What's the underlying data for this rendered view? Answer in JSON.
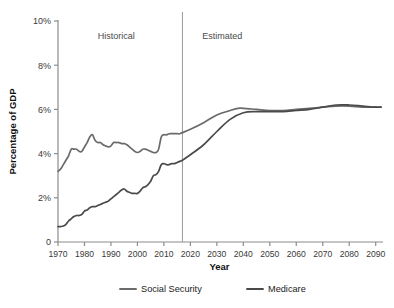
{
  "chart_data": {
    "type": "line",
    "title": "",
    "xlabel": "Year",
    "ylabel": "Percentage of GDP",
    "xlim": [
      1970,
      2092
    ],
    "ylim": [
      0,
      10
    ],
    "grid": false,
    "legend_position": "bottom",
    "x_ticks": [
      1970,
      1980,
      1990,
      2000,
      2010,
      2020,
      2030,
      2040,
      2050,
      2060,
      2070,
      2080,
      2090
    ],
    "x_tick_labels": [
      "1970",
      "1980",
      "1990",
      "2000",
      "2010",
      "2020",
      "2030",
      "2040",
      "2050",
      "2060",
      "2070",
      "2080",
      "2090"
    ],
    "y_ticks": [
      0,
      2,
      4,
      6,
      8,
      10
    ],
    "y_tick_labels": [
      "0",
      "2%",
      "4%",
      "6%",
      "8%",
      "10%"
    ],
    "annotations": [
      {
        "name": "historical-label",
        "text": "Historical",
        "x": 1992,
        "y": 9.2
      },
      {
        "name": "estimated-label",
        "text": "Estimated",
        "x": 2032,
        "y": 9.2
      },
      {
        "name": "divider-line",
        "text": "",
        "x": 2017,
        "y": 0
      }
    ],
    "divider_year": 2017,
    "colors": {
      "social_security": "#6a6a6a",
      "medicare": "#4a4a4a",
      "axis": "#8c8c8c",
      "divider": "#9a9a9a",
      "text": "#333333"
    },
    "series": [
      {
        "name": "Social Security",
        "color": "#6a6a6a",
        "x": [
          1970,
          1971,
          1972,
          1973,
          1974,
          1975,
          1976,
          1977,
          1978,
          1979,
          1980,
          1981,
          1982,
          1983,
          1984,
          1985,
          1986,
          1987,
          1988,
          1989,
          1990,
          1991,
          1992,
          1993,
          1994,
          1995,
          1996,
          1997,
          1998,
          1999,
          2000,
          2001,
          2002,
          2003,
          2004,
          2005,
          2006,
          2007,
          2008,
          2009,
          2010,
          2011,
          2012,
          2013,
          2014,
          2015,
          2016,
          2017,
          2020,
          2025,
          2030,
          2035,
          2038,
          2040,
          2045,
          2050,
          2055,
          2060,
          2065,
          2070,
          2075,
          2080,
          2085,
          2090,
          2092
        ],
        "y": [
          3.2,
          3.3,
          3.5,
          3.7,
          3.9,
          4.2,
          4.2,
          4.2,
          4.1,
          4.1,
          4.3,
          4.5,
          4.75,
          4.85,
          4.6,
          4.5,
          4.5,
          4.4,
          4.35,
          4.3,
          4.35,
          4.5,
          4.5,
          4.5,
          4.45,
          4.45,
          4.4,
          4.3,
          4.2,
          4.1,
          4.05,
          4.1,
          4.2,
          4.2,
          4.15,
          4.1,
          4.05,
          4.05,
          4.2,
          4.75,
          4.85,
          4.85,
          4.9,
          4.9,
          4.9,
          4.9,
          4.9,
          4.95,
          5.1,
          5.4,
          5.75,
          5.95,
          6.05,
          6.05,
          6.0,
          5.95,
          5.95,
          6.0,
          6.05,
          6.1,
          6.15,
          6.15,
          6.1,
          6.1,
          6.1
        ]
      },
      {
        "name": "Medicare",
        "color": "#4a4a4a",
        "x": [
          1970,
          1971,
          1972,
          1973,
          1974,
          1975,
          1976,
          1977,
          1978,
          1979,
          1980,
          1981,
          1982,
          1983,
          1984,
          1985,
          1986,
          1987,
          1988,
          1989,
          1990,
          1991,
          1992,
          1993,
          1994,
          1995,
          1996,
          1997,
          1998,
          1999,
          2000,
          2001,
          2002,
          2003,
          2004,
          2005,
          2006,
          2007,
          2008,
          2009,
          2010,
          2011,
          2012,
          2013,
          2014,
          2015,
          2016,
          2017,
          2020,
          2025,
          2030,
          2035,
          2040,
          2045,
          2050,
          2055,
          2060,
          2065,
          2070,
          2075,
          2080,
          2085,
          2090,
          2092
        ],
        "y": [
          0.7,
          0.7,
          0.72,
          0.8,
          0.95,
          1.05,
          1.15,
          1.2,
          1.2,
          1.25,
          1.4,
          1.45,
          1.55,
          1.6,
          1.6,
          1.65,
          1.7,
          1.75,
          1.8,
          1.85,
          1.95,
          2.05,
          2.15,
          2.25,
          2.35,
          2.4,
          2.3,
          2.25,
          2.2,
          2.2,
          2.2,
          2.3,
          2.45,
          2.5,
          2.6,
          2.75,
          3.0,
          3.05,
          3.2,
          3.5,
          3.55,
          3.5,
          3.5,
          3.55,
          3.55,
          3.6,
          3.65,
          3.7,
          3.95,
          4.4,
          5.0,
          5.55,
          5.85,
          5.9,
          5.9,
          5.9,
          5.95,
          6.0,
          6.1,
          6.2,
          6.2,
          6.15,
          6.1,
          6.1
        ]
      }
    ],
    "legend": [
      {
        "label": "Social Security",
        "color": "#6a6a6a"
      },
      {
        "label": "Medicare",
        "color": "#4a4a4a"
      }
    ]
  }
}
